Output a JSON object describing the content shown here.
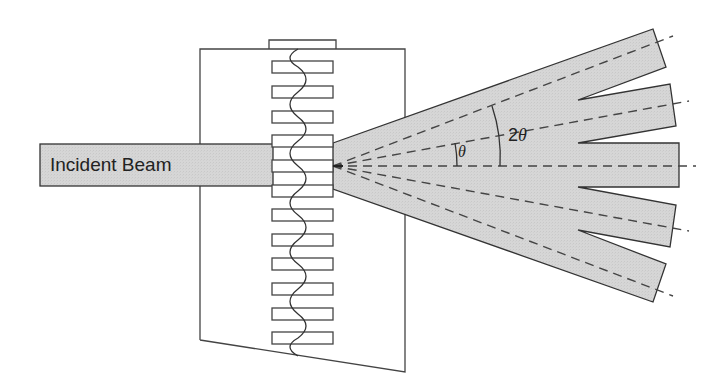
{
  "figure": {
    "incident_beam_label": "Incident Beam",
    "angle_labels": {
      "theta": "θ",
      "two_theta_prefix": "2",
      "two_theta_symbol": "θ"
    },
    "colors": {
      "beam_fill": "#d4d4d4",
      "stroke": "#333333",
      "dash": "#444444",
      "background": "#ffffff"
    },
    "grating": {
      "slit_count": 12,
      "slit_x": 272,
      "slit_width": 61,
      "slit_height": 12,
      "slit_y": [
        61,
        86,
        111,
        135,
        160,
        185,
        209,
        234,
        258,
        283,
        308,
        332
      ]
    },
    "diffracted_orders": [
      "+2",
      "+1",
      "0",
      "-1",
      "-2"
    ]
  }
}
